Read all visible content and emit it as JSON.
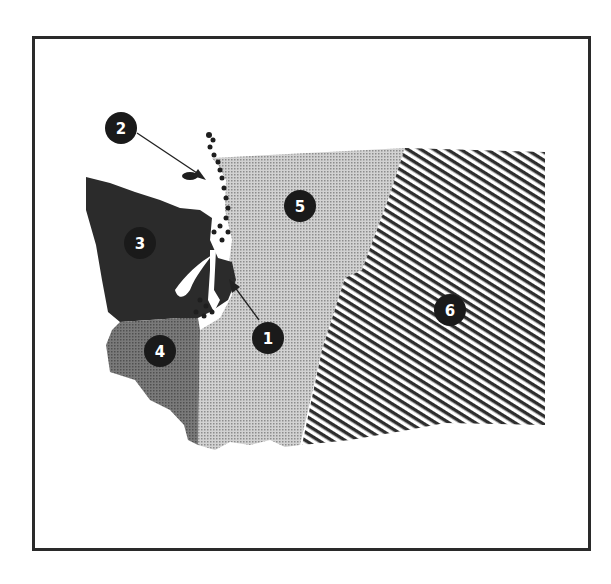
{
  "figure": {
    "type": "numbered regions map"
  },
  "regions": [
    {
      "id": "1",
      "label": "1",
      "pattern": "solid-dark",
      "description": "Puget Sound lowland strip (pointed to by arrow)"
    },
    {
      "id": "2",
      "label": "2",
      "pattern": "solid-dark",
      "description": "San Juan Islands (pointed to by arrow)"
    },
    {
      "id": "3",
      "label": "3",
      "pattern": "solid-dark",
      "color": "#2b2b2b",
      "description": "Olympic Peninsula"
    },
    {
      "id": "4",
      "label": "4",
      "pattern": "medium-gray",
      "color": "#6e6e6e",
      "description": "Southwest coast"
    },
    {
      "id": "5",
      "label": "5",
      "pattern": "light-dot",
      "color": "#bdbdbd",
      "description": "Cascade region"
    },
    {
      "id": "6",
      "label": "6",
      "pattern": "diagonal-hatch",
      "color": "#333333",
      "description": "Eastern Washington"
    }
  ],
  "colors": {
    "frame": "#2a2a2a",
    "badge": "#1a1a1a",
    "badge_text": "#ffffff",
    "region3": "#2b2b2b",
    "region4": "#6e6e6e",
    "region5": "#bdbdbd",
    "region6_stripe": "#333333"
  }
}
